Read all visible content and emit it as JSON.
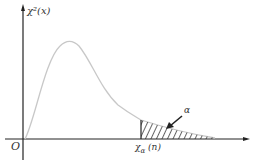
{
  "diagram": {
    "y_axis_label": "χ²(x)",
    "origin_label": "O",
    "critical_label": "χ²α (n)",
    "critical_label_main": "χ",
    "critical_label_sub": "α",
    "critical_label_sup": "2",
    "critical_label_arg": "(n)",
    "tail_label": "α",
    "colors": {
      "axis": "#222222",
      "curve": "#c8c8c8",
      "hatch": "#222222",
      "text": "#333333"
    }
  }
}
